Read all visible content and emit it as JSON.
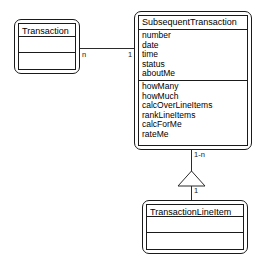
{
  "diagram": {
    "type": "uml-class-diagram",
    "background_color": "#ffffff",
    "line_color": "#2b2b2b",
    "classes": [
      {
        "id": "transaction",
        "name": "Transaction",
        "attributes": [],
        "operations": []
      },
      {
        "id": "subsequent_transaction",
        "name": "SubsequentTransaction",
        "attributes": [
          "number",
          "date",
          "time",
          "status",
          "aboutMe"
        ],
        "operations": [
          "howMany",
          "howMuch",
          "calcOverLineItems",
          "rankLineItems",
          "calcForMe",
          "rateMe"
        ]
      },
      {
        "id": "transaction_line_item",
        "name": "TransactionLineItem",
        "attributes": [],
        "operations": []
      }
    ],
    "relationships": [
      {
        "id": "assoc-transaction-subsequent",
        "kind": "association",
        "source": "Transaction",
        "target": "SubsequentTransaction",
        "source_multiplicity": "n",
        "target_multiplicity": "1"
      },
      {
        "id": "gen-lineitem-subsequent",
        "kind": "generalization",
        "source": "TransactionLineItem",
        "target": "SubsequentTransaction",
        "target_multiplicity": "1-n",
        "source_multiplicity": "1",
        "arrowhead": "hollow-triangle-up"
      }
    ]
  }
}
